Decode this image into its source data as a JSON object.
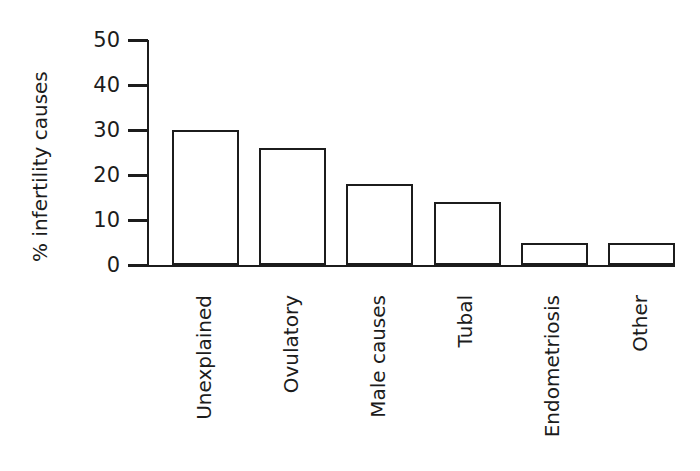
{
  "chart_data": {
    "type": "bar",
    "categories": [
      "Unexplained",
      "Ovulatory",
      "Male causes",
      "Tubal",
      "Endometriosis",
      "Other"
    ],
    "values": [
      30,
      26,
      18,
      14,
      5,
      5
    ],
    "title": "",
    "xlabel": "",
    "ylabel": "% infertility causes",
    "ylim": [
      0,
      50
    ],
    "yticks": [
      0,
      10,
      20,
      30,
      40,
      50
    ],
    "grid": false,
    "legend": null,
    "bar_fill": "#ffffff",
    "stroke_color": "#1c1c1c",
    "background": "#ffffff"
  }
}
